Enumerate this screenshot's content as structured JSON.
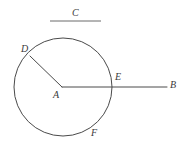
{
  "figure": {
    "type": "geometry-diagram",
    "background_color": "#ffffff",
    "stroke_color": "#4a4a4a",
    "label_color": "#3a3a3a",
    "title": {
      "text": "C",
      "underline": true
    },
    "labels": {
      "c": "C",
      "d": "D",
      "a": "A",
      "e": "E",
      "b": "B",
      "f": "F"
    },
    "circle": {
      "center_x": 63,
      "center_y": 87,
      "radius": 49
    },
    "points": [
      {
        "name": "A",
        "x": 62,
        "y": 87,
        "role": "center"
      },
      {
        "name": "D",
        "x": 30,
        "y": 56,
        "role": "on-circle"
      },
      {
        "name": "E",
        "x": 111,
        "y": 87,
        "role": "on-circle"
      },
      {
        "name": "B",
        "x": 167,
        "y": 87,
        "role": "ray-endpoint"
      },
      {
        "name": "F",
        "x": 88,
        "y": 133,
        "role": "on-circle"
      }
    ],
    "segments": [
      {
        "name": "AD",
        "from": "A",
        "to": "D"
      },
      {
        "name": "AB",
        "from": "A",
        "to": "B"
      }
    ],
    "title_rule": {
      "x1": 50,
      "y1": 21,
      "x2": 101,
      "y2": 21
    }
  }
}
